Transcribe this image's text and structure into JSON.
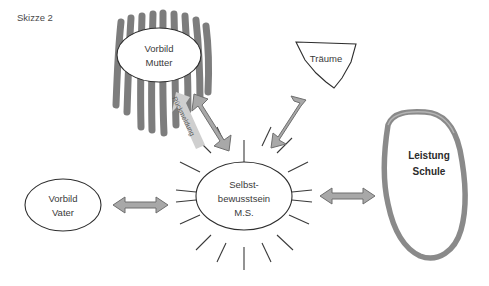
{
  "caption": {
    "text": "Skizze 2"
  },
  "diagram": {
    "center": {
      "name": "selbstbewusstsein",
      "lines": [
        "Selbst-",
        "bewusstsein",
        "M.S."
      ]
    },
    "nodes": [
      {
        "id": "vorbild-mutter",
        "lines": [
          "Vorbild",
          "Mutter"
        ],
        "shape": "ellipse-with-scribble"
      },
      {
        "id": "traeume",
        "lines": [
          "Träume"
        ],
        "shape": "cup-polygon"
      },
      {
        "id": "leistung-schule",
        "lines": [
          "Leistung",
          "Schule"
        ],
        "shape": "thick-blob"
      },
      {
        "id": "vorbild-vater",
        "lines": [
          "Vorbild",
          "Vater"
        ],
        "shape": "ellipse"
      }
    ],
    "edges": [
      {
        "id": "edge-mutter",
        "label": "Rückmeldung",
        "from": "selbstbewusstsein",
        "to": "vorbild-mutter",
        "style": "double-arrow-diagonal"
      },
      {
        "id": "edge-traeume",
        "label": "",
        "from": "selbstbewusstsein",
        "to": "traeume",
        "style": "double-arrow-diagonal"
      },
      {
        "id": "edge-schule",
        "label": "",
        "from": "selbstbewusstsein",
        "to": "leistung-schule",
        "style": "double-arrow-horizontal"
      },
      {
        "id": "edge-vater",
        "label": "",
        "from": "vorbild-vater",
        "to": "selbstbewusstsein",
        "style": "double-arrow-horizontal"
      }
    ],
    "colors": {
      "scribble": "#7d7d7d",
      "arrow_fill": "#a8a8a8",
      "arrow_stroke": "#6f6f6f",
      "blob_stroke": "#8a8a8a",
      "outline": "#2e2e2e",
      "text": "#3a3a3a",
      "background": "#ffffff"
    },
    "rays": {
      "count": 16,
      "hidden_at": [
        "left-horizontal",
        "right-horizontal"
      ]
    }
  }
}
